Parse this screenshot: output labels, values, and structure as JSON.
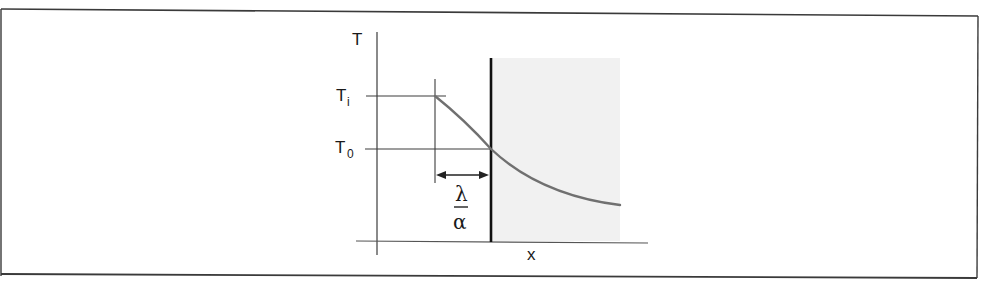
{
  "diagram": {
    "type": "temperature-profile-sketch",
    "axes": {
      "y_label": "T",
      "x_label": "x"
    },
    "levels": [
      {
        "id": "Ti",
        "base": "T",
        "subscript": "i"
      },
      {
        "id": "T0",
        "base": "T",
        "subscript": "0"
      }
    ],
    "dimension": {
      "numerator": "λ",
      "denominator": "α",
      "meaning": "extrapolation distance"
    },
    "wall": {
      "description": "solid boundary (shaded region right of wall)"
    },
    "colors": {
      "frame": "#3a3a3a",
      "axis": "#3c3c3c",
      "wall": "#111111",
      "curve": "#707070",
      "shade": "#f1f1f1"
    }
  }
}
